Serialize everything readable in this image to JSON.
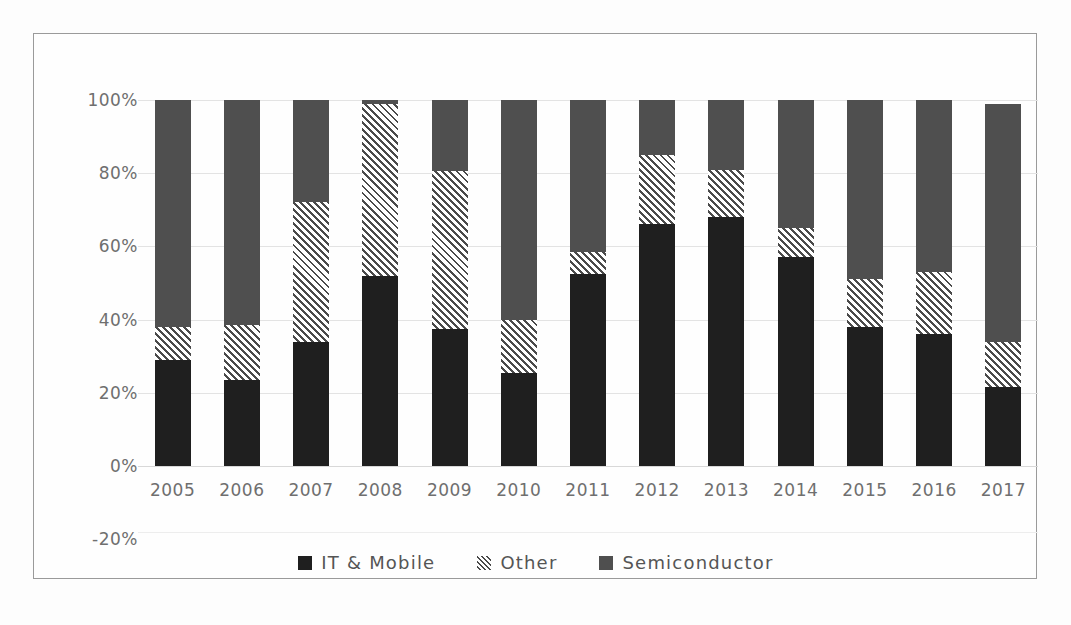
{
  "chart_data": {
    "type": "bar",
    "subtype": "stacked-100-percent",
    "title": "",
    "xlabel": "",
    "ylabel": "",
    "categories": [
      "2005",
      "2006",
      "2007",
      "2008",
      "2009",
      "2010",
      "2011",
      "2012",
      "2013",
      "2014",
      "2015",
      "2016",
      "2017"
    ],
    "series": [
      {
        "name": "IT & Mobile",
        "color": "#1f1f1f",
        "pattern": "solid",
        "values": [
          29,
          23.5,
          34,
          52,
          37.5,
          25.5,
          52.5,
          66,
          68,
          57,
          38,
          36,
          21.5
        ]
      },
      {
        "name": "Other",
        "color": "#4a4a4a",
        "pattern": "diagonal-hatch",
        "values": [
          9,
          15,
          38,
          47,
          43,
          14.5,
          6,
          19,
          13,
          8,
          13,
          17,
          12.5
        ]
      },
      {
        "name": "Semiconductor",
        "color": "#4f4f4f",
        "pattern": "solid",
        "values": [
          62,
          61.5,
          28,
          1,
          19.5,
          60,
          41.5,
          15,
          19,
          35,
          49,
          47,
          65
        ]
      }
    ],
    "ylim": [
      -20,
      100
    ],
    "yticks": [
      "100%",
      "80%",
      "60%",
      "40%",
      "20%",
      "0%",
      "-20%"
    ],
    "ytick_values": [
      100,
      80,
      60,
      40,
      20,
      0,
      -20
    ],
    "grid": true,
    "legend_position": "bottom",
    "legend": [
      "IT & Mobile",
      "Other",
      "Semiconductor"
    ],
    "annotations": []
  },
  "colors": {
    "it_mobile": "#1f1f1f",
    "other": "#4a4a4a",
    "semiconductor": "#4f4f4f",
    "gridline": "#e3e3e3",
    "frame_border": "#9a9a9a",
    "tick_text": "#6f6f6f",
    "legend_text": "#555555",
    "background": "#fefefe"
  }
}
